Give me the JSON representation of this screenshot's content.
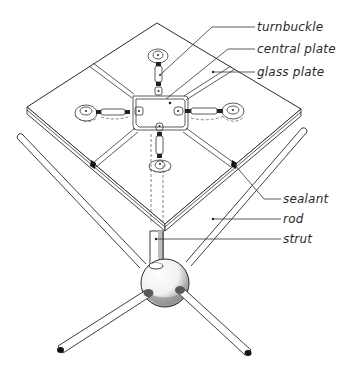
{
  "diagram": {
    "type": "isometric technical illustration",
    "colors": {
      "line": "#2a2a2a",
      "hub_shadow": "#9a9a9a",
      "background": "#ffffff"
    }
  },
  "labels": {
    "turnbuckle": "turnbuckle",
    "central_plate": "central plate",
    "glass_plate": "glass plate",
    "sealant": "sealant",
    "rod": "rod",
    "strut": "strut"
  }
}
